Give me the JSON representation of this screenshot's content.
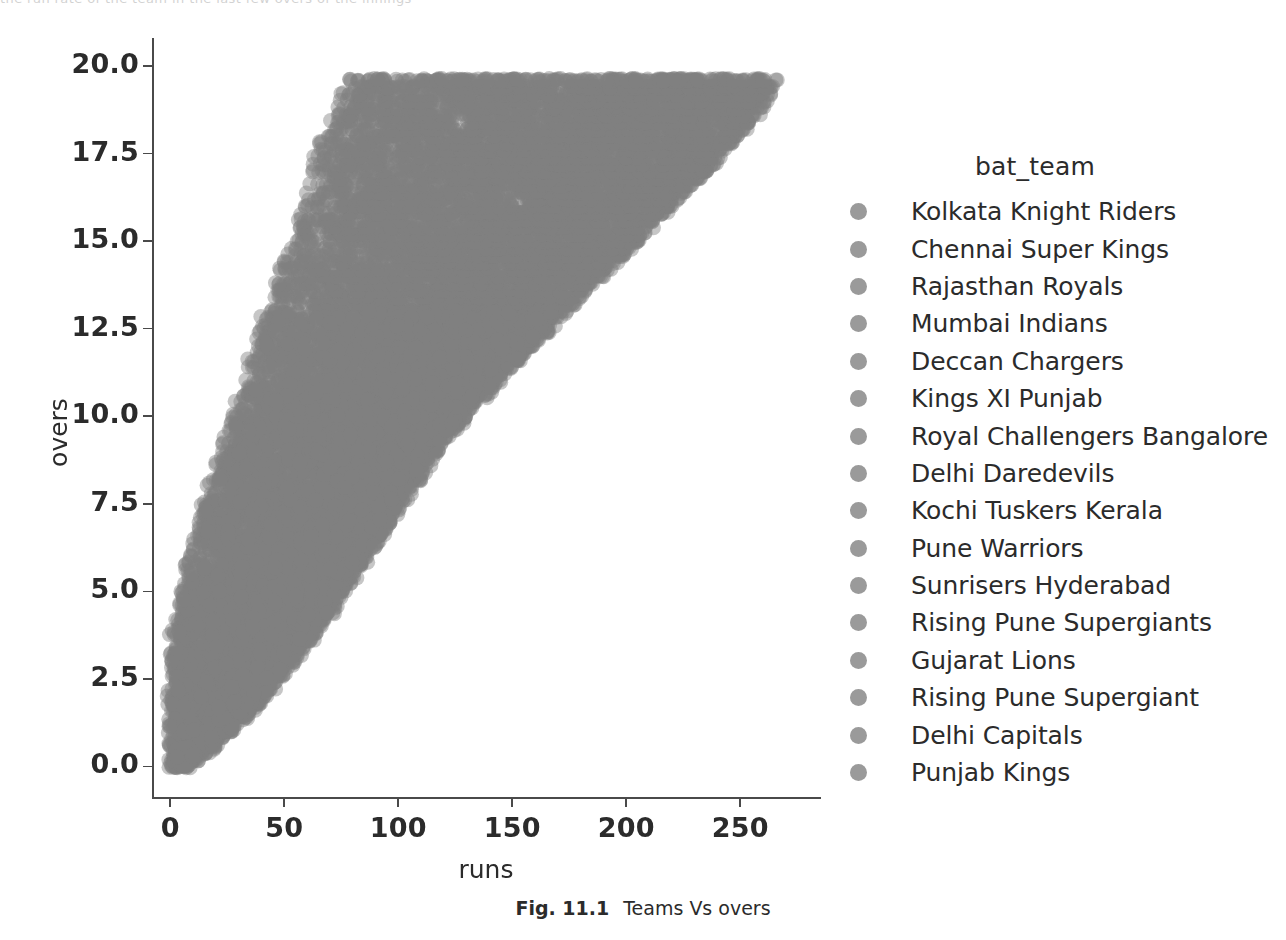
{
  "figure": {
    "caption_number": "Fig. 11.1",
    "caption_text": "Teams Vs overs"
  },
  "top_bleed": {
    "fragment": "the run rate of the team in the last few overs of the innings"
  },
  "legend": {
    "title": "bat_team",
    "marker_color": "#9a9a9a",
    "items": [
      {
        "label": "Kolkata Knight Riders"
      },
      {
        "label": "Chennai Super Kings"
      },
      {
        "label": "Rajasthan Royals"
      },
      {
        "label": "Mumbai Indians"
      },
      {
        "label": "Deccan Chargers"
      },
      {
        "label": "Kings XI Punjab"
      },
      {
        "label": "Royal Challengers Bangalore"
      },
      {
        "label": "Delhi Daredevils"
      },
      {
        "label": "Kochi Tuskers Kerala"
      },
      {
        "label": "Pune Warriors"
      },
      {
        "label": "Sunrisers Hyderabad"
      },
      {
        "label": "Rising Pune Supergiants"
      },
      {
        "label": "Gujarat Lions"
      },
      {
        "label": "Rising Pune Supergiant"
      },
      {
        "label": "Delhi Capitals"
      },
      {
        "label": "Punjab Kings"
      }
    ]
  },
  "chart_data": {
    "type": "scatter",
    "title": "",
    "xlabel": "runs",
    "ylabel": "overs",
    "xlim": [
      -8,
      285
    ],
    "ylim": [
      -0.9,
      20.8
    ],
    "xticks": [
      0,
      50,
      100,
      150,
      200,
      250
    ],
    "xticklabels": [
      "0",
      "50",
      "100",
      "150",
      "200",
      "250"
    ],
    "yticks": [
      0.0,
      2.5,
      5.0,
      7.5,
      10.0,
      12.5,
      15.0,
      17.5,
      20.0
    ],
    "yticklabels": [
      "0.0",
      "2.5",
      "5.0",
      "7.5",
      "10.0",
      "12.5",
      "15.0",
      "17.5",
      "20.0"
    ],
    "grid": false,
    "legend_position": "right",
    "legend_title": "bat_team",
    "point_color": "#8f8f8f",
    "point_alpha": 0.45,
    "point_radius_px": 7.5,
    "hue_field": "bat_team",
    "series": [
      {
        "name": "Kolkata Knight Riders"
      },
      {
        "name": "Chennai Super Kings"
      },
      {
        "name": "Rajasthan Royals"
      },
      {
        "name": "Mumbai Indians"
      },
      {
        "name": "Deccan Chargers"
      },
      {
        "name": "Kings XI Punjab"
      },
      {
        "name": "Royal Challengers Bangalore"
      },
      {
        "name": "Delhi Daredevils"
      },
      {
        "name": "Kochi Tuskers Kerala"
      },
      {
        "name": "Pune Warriors"
      },
      {
        "name": "Sunrisers Hyderabad"
      },
      {
        "name": "Rising Pune Supergiants"
      },
      {
        "name": "Gujarat Lions"
      },
      {
        "name": "Rising Pune Supergiant"
      },
      {
        "name": "Delhi Capitals"
      },
      {
        "name": "Punjab Kings"
      }
    ],
    "over_bands": [
      0.0,
      0.2,
      0.4,
      0.6,
      0.8,
      1.0,
      1.2,
      1.4,
      1.6,
      1.8,
      2.0,
      2.2,
      2.4,
      2.6,
      2.8,
      3.0,
      3.2,
      3.4,
      3.6,
      3.8,
      4.0,
      4.2,
      4.4,
      4.6,
      4.8,
      5.0,
      5.2,
      5.4,
      5.6,
      5.8,
      6.0,
      6.2,
      6.4,
      6.6,
      6.8,
      7.0,
      7.2,
      7.4,
      7.6,
      7.8,
      8.0,
      8.2,
      8.4,
      8.6,
      8.8,
      9.0,
      9.2,
      9.4,
      9.6,
      9.8,
      10.0,
      10.2,
      10.4,
      10.6,
      10.8,
      11.0,
      11.2,
      11.4,
      11.6,
      11.8,
      12.0,
      12.2,
      12.4,
      12.6,
      12.8,
      13.0,
      13.2,
      13.4,
      13.6,
      13.8,
      14.0,
      14.2,
      14.4,
      14.6,
      14.8,
      15.0,
      15.2,
      15.4,
      15.6,
      15.8,
      16.0,
      16.2,
      16.4,
      16.6,
      16.8,
      17.0,
      17.2,
      17.4,
      17.6,
      17.8,
      18.0,
      18.2,
      18.4,
      18.6,
      18.8,
      19.0,
      19.2,
      19.4,
      19.6
    ],
    "runs_envelope_lower": [
      0,
      0,
      0,
      0,
      0,
      0,
      0,
      0,
      0,
      0,
      0,
      0,
      0,
      0,
      0,
      0,
      0,
      1,
      1,
      1,
      2,
      2,
      3,
      3,
      4,
      5,
      5,
      6,
      6,
      7,
      8,
      8,
      9,
      10,
      11,
      12,
      13,
      14,
      15,
      16,
      17,
      18,
      19,
      20,
      21,
      22,
      23,
      24,
      25,
      26,
      27,
      28,
      29,
      30,
      31,
      32,
      33,
      34,
      35,
      36,
      37,
      38,
      39,
      40,
      41,
      42,
      43,
      44,
      45,
      46,
      47,
      48,
      49,
      50,
      51,
      52,
      53,
      54,
      55,
      56,
      57,
      58,
      59,
      60,
      61,
      62,
      63,
      64,
      65,
      66,
      67,
      68,
      69,
      70,
      71,
      72,
      73,
      74,
      75
    ],
    "runs_envelope_upper": [
      8,
      12,
      16,
      20,
      24,
      27,
      30,
      33,
      36,
      39,
      42,
      45,
      47,
      50,
      52,
      55,
      57,
      60,
      62,
      64,
      66,
      69,
      71,
      73,
      75,
      77,
      79,
      81,
      83,
      85,
      87,
      89,
      91,
      93,
      95,
      97,
      99,
      101,
      103,
      105,
      107,
      109,
      111,
      113,
      115,
      118,
      120,
      122,
      125,
      127,
      130,
      132,
      135,
      138,
      141,
      144,
      147,
      150,
      153,
      156,
      159,
      162,
      165,
      168,
      171,
      174,
      177,
      180,
      183,
      186,
      189,
      192,
      196,
      199,
      202,
      205,
      208,
      211,
      214,
      217,
      220,
      223,
      226,
      229,
      232,
      235,
      238,
      241,
      244,
      247,
      250,
      253,
      255,
      258,
      260,
      262,
      263,
      264,
      265
    ]
  }
}
